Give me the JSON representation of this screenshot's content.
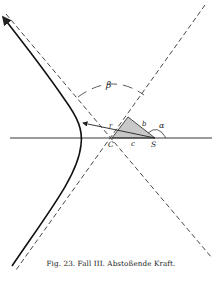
{
  "caption": "Fig. 23.  Fall III.  Abstoßende Kraft.",
  "labels": {
    "beta": "β",
    "alpha": "α",
    "r": "r",
    "b": "b",
    "c": "c",
    "C": "C",
    "S": "S"
  },
  "colors": {
    "line": "#222222",
    "shade": "#c8c8c8",
    "background": "#ffffff"
  }
}
